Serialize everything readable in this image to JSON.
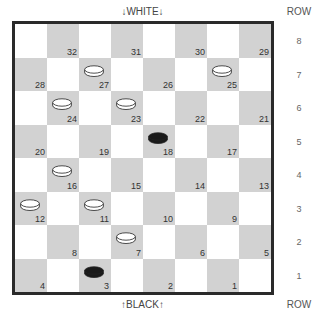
{
  "labels": {
    "top": "↓WHITE↓",
    "bottom": "↑BLACK↑",
    "row_header_top": "ROW",
    "row_header_bottom": "ROW"
  },
  "rows": [
    "8",
    "7",
    "6",
    "5",
    "4",
    "3",
    "2",
    "1"
  ],
  "colors": {
    "dark_square": "#d2d2d2",
    "light_square": "#ffffff",
    "border": "#2a2a2a",
    "white_piece": "#ffffff",
    "black_piece": "#1a1a1a"
  },
  "squares": [
    {
      "n": "32",
      "row": 0,
      "col": 1
    },
    {
      "n": "31",
      "row": 0,
      "col": 3
    },
    {
      "n": "30",
      "row": 0,
      "col": 5
    },
    {
      "n": "29",
      "row": 0,
      "col": 7
    },
    {
      "n": "28",
      "row": 1,
      "col": 0
    },
    {
      "n": "27",
      "row": 1,
      "col": 2,
      "piece": "white"
    },
    {
      "n": "26",
      "row": 1,
      "col": 4
    },
    {
      "n": "25",
      "row": 1,
      "col": 6,
      "piece": "white"
    },
    {
      "n": "24",
      "row": 2,
      "col": 1,
      "piece": "white"
    },
    {
      "n": "23",
      "row": 2,
      "col": 3,
      "piece": "white"
    },
    {
      "n": "22",
      "row": 2,
      "col": 5
    },
    {
      "n": "21",
      "row": 2,
      "col": 7
    },
    {
      "n": "20",
      "row": 3,
      "col": 0
    },
    {
      "n": "19",
      "row": 3,
      "col": 2
    },
    {
      "n": "18",
      "row": 3,
      "col": 4,
      "piece": "black"
    },
    {
      "n": "17",
      "row": 3,
      "col": 6
    },
    {
      "n": "16",
      "row": 4,
      "col": 1,
      "piece": "white"
    },
    {
      "n": "15",
      "row": 4,
      "col": 3
    },
    {
      "n": "14",
      "row": 4,
      "col": 5
    },
    {
      "n": "13",
      "row": 4,
      "col": 7
    },
    {
      "n": "12",
      "row": 5,
      "col": 0,
      "piece": "white"
    },
    {
      "n": "11",
      "row": 5,
      "col": 2,
      "piece": "white"
    },
    {
      "n": "10",
      "row": 5,
      "col": 4
    },
    {
      "n": "9",
      "row": 5,
      "col": 6
    },
    {
      "n": "8",
      "row": 6,
      "col": 1
    },
    {
      "n": "7",
      "row": 6,
      "col": 3,
      "piece": "white"
    },
    {
      "n": "6",
      "row": 6,
      "col": 5
    },
    {
      "n": "5",
      "row": 6,
      "col": 7
    },
    {
      "n": "4",
      "row": 7,
      "col": 0
    },
    {
      "n": "3",
      "row": 7,
      "col": 2,
      "piece": "black"
    },
    {
      "n": "2",
      "row": 7,
      "col": 4
    },
    {
      "n": "1",
      "row": 7,
      "col": 6
    }
  ]
}
